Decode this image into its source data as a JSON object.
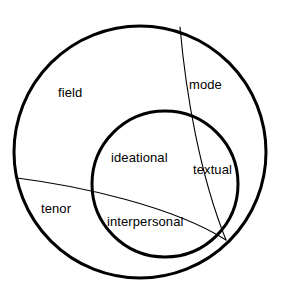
{
  "diagram": {
    "type": "venn-overlapping-circles",
    "background_color": "#ffffff",
    "stroke_color": "#000000",
    "thick_stroke_width": 3,
    "thin_stroke_width": 1,
    "shapes": {
      "outer_circle": {
        "name": "register-circle",
        "cx": 140,
        "cy": 152,
        "r": 126,
        "stroke_width": 3
      },
      "inner_circle": {
        "name": "metafunction-circle",
        "cx": 165,
        "cy": 184,
        "r": 73,
        "stroke_width": 3
      },
      "mode_divider": {
        "name": "mode-divider-arc",
        "from_x": 180,
        "from_y": 27,
        "to_x": 226,
        "to_y": 240,
        "stroke_width": 1
      },
      "tenor_divider": {
        "name": "tenor-divider-arc",
        "from_x": 17,
        "from_y": 178,
        "to_x": 226,
        "to_y": 240,
        "stroke_width": 1
      },
      "convergence_point": {
        "name": "bottom-right-convergence",
        "x": 226,
        "y": 240
      }
    },
    "labels": {
      "field": "field",
      "mode": "mode",
      "tenor": "tenor",
      "ideational": "ideational",
      "interpersonal": "interpersonal",
      "textual": "textual"
    }
  }
}
